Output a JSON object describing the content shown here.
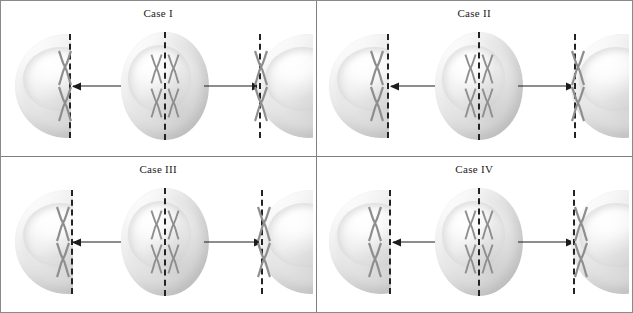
{
  "figure": {
    "title": "",
    "border_color": "#8a8a8a",
    "divider_color": "#808080",
    "chromosome_color": "#8e8e8e",
    "line_color": "#1c1c1c",
    "dashed_line_color": "#232323"
  },
  "panels": [
    {
      "id": "case-1",
      "label": "Case I",
      "mother_cell": {
        "name": "mother-cell",
        "chromosome_rows": 2,
        "chromosome_cols": 2,
        "plane_label": "metaphase-plate"
      },
      "left_daughter": {
        "name": "left-daughter-cell",
        "chromosome_count": 2,
        "chromosomes_side": "on-plane",
        "arrow": "arrow-left"
      },
      "right_daughter": {
        "name": "right-daughter-cell",
        "chromosome_count": 2,
        "chromosomes_side": "on-plane",
        "arrow": "arrow-right"
      }
    },
    {
      "id": "case-2",
      "label": "Case II",
      "mother_cell": {
        "name": "mother-cell",
        "chromosome_rows": 2,
        "chromosome_cols": 2,
        "plane_label": "metaphase-plate"
      },
      "left_daughter": {
        "name": "left-daughter-cell",
        "chromosome_count": 2,
        "chromosomes_side": "inside-left-of-plane",
        "arrow": "arrow-left"
      },
      "right_daughter": {
        "name": "right-daughter-cell",
        "chromosome_count": 2,
        "chromosomes_side": "on-plane",
        "arrow": "arrow-right"
      }
    },
    {
      "id": "case-3",
      "label": "Case III",
      "mother_cell": {
        "name": "mother-cell",
        "chromosome_rows": 2,
        "chromosome_cols": 2,
        "plane_label": "metaphase-plate"
      },
      "left_daughter": {
        "name": "left-daughter-cell",
        "chromosome_count": 2,
        "chromosomes_side": "inside-left-of-plane",
        "arrow": "arrow-left"
      },
      "right_daughter": {
        "name": "right-daughter-cell",
        "chromosome_count": 2,
        "chromosomes_side": "on-plane",
        "arrow": "arrow-right"
      }
    },
    {
      "id": "case-4",
      "label": "Case IV",
      "mother_cell": {
        "name": "mother-cell",
        "chromosome_rows": 2,
        "chromosome_cols": 2,
        "plane_label": "metaphase-plate"
      },
      "left_daughter": {
        "name": "left-daughter-cell",
        "chromosome_count": 2,
        "chromosomes_side": "inside-left-of-plane",
        "arrow": "arrow-left"
      },
      "right_daughter": {
        "name": "right-daughter-cell",
        "chromosome_count": 2,
        "chromosomes_side": "inside-right-of-plane",
        "arrow": "arrow-right"
      }
    }
  ]
}
